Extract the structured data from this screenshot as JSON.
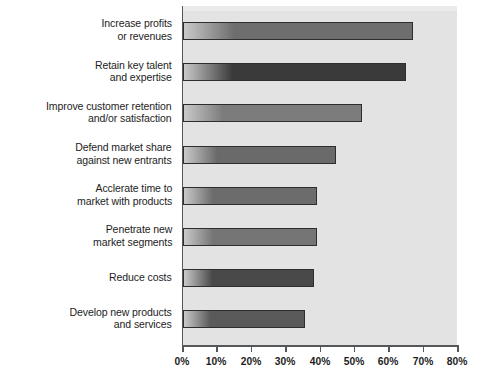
{
  "chart_data": {
    "type": "bar",
    "orientation": "horizontal",
    "title": "",
    "subtitle": "",
    "xlabel": "",
    "ylabel": "",
    "xlim": [
      0,
      80
    ],
    "xtick_labels": [
      "0%",
      "10%",
      "20%",
      "30%",
      "40%",
      "50%",
      "60%",
      "70%",
      "80%"
    ],
    "xtick_values": [
      0,
      10,
      20,
      30,
      40,
      50,
      60,
      70,
      80
    ],
    "grid": false,
    "legend": false,
    "unit": "%",
    "categories": [
      "Increase profits\nor revenues",
      "Retain key talent\nand expertise",
      "Improve customer retention\nand/or satisfaction",
      "Defend market share\nagainst new entrants",
      "Acclerate time to\nmarket with products",
      "Penetrate new\nmarket segments",
      "Reduce costs",
      "Develop new products\nand services"
    ],
    "values": [
      67,
      65,
      52,
      44.5,
      39,
      39,
      38,
      35.5
    ],
    "bar_colors": [
      "#6e6e6e",
      "#3a3a3a",
      "#7c7c7c",
      "#6a6a6a",
      "#6c6c6c",
      "#757575",
      "#494949",
      "#5a5a5a"
    ]
  },
  "style": {
    "plot_background": "#e3e3e3",
    "axis_color": "#55585a",
    "text_color": "#1d1d1d",
    "page_background": "#ffffff"
  }
}
